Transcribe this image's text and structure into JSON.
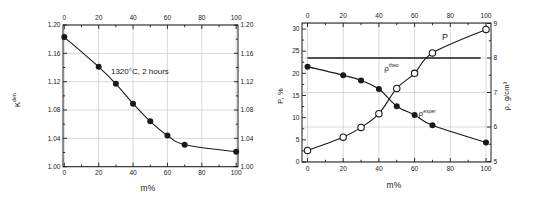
{
  "colors": {
    "ink": "#1a1a1a",
    "grid": "#c9c9c9",
    "paper": "#ffffff"
  },
  "chart_data": [
    {
      "type": "line",
      "title": "",
      "xlabel": "m%",
      "ylabel_base": "K",
      "ylabel_sup": "den",
      "xlim": [
        0,
        100
      ],
      "ylim": [
        1.0,
        1.2
      ],
      "x_ticks": [
        0,
        20,
        40,
        60,
        80,
        100
      ],
      "x_minor_step": 10,
      "y_ticks": [
        1.0,
        1.04,
        1.08,
        1.12,
        1.16,
        1.2
      ],
      "y_tick_labels": [
        "1.00",
        "1.04",
        "1.08",
        "1.12",
        "1.16",
        "1.20"
      ],
      "y_minor_step": 0.02,
      "grid": true,
      "mirror_right_axis": true,
      "legend": "none",
      "annotations": [
        {
          "base": "1320°C, 2 hours",
          "sup": "",
          "x": 44,
          "y": 1.131,
          "size": 8
        }
      ],
      "series": [
        {
          "name": "K",
          "marker": "filled-circle",
          "line": "smooth",
          "x": [
            0,
            20,
            30,
            40,
            50,
            60,
            70,
            100
          ],
          "y": [
            1.183,
            1.141,
            1.117,
            1.089,
            1.064,
            1.044,
            1.031,
            1.021
          ]
        }
      ]
    },
    {
      "type": "line",
      "title": "",
      "xlabel": "m%",
      "ylabel_left": "P, %",
      "ylabel_right": "ρ, g/cm³",
      "xlim": [
        0,
        100
      ],
      "ylim_left": [
        0,
        30
      ],
      "ylim_right": [
        5,
        9
      ],
      "x_ticks": [
        0,
        20,
        40,
        60,
        80,
        100
      ],
      "x_minor_step": 10,
      "y_left_ticks": [
        0,
        5,
        10,
        15,
        20,
        25,
        30
      ],
      "y_left_minor_step": 2.5,
      "y_right_ticks": [
        5,
        6,
        7,
        8,
        9
      ],
      "y_right_minor_step": 0.5,
      "grid": true,
      "legend": "none",
      "annotations": [
        {
          "base": "P",
          "sup": "",
          "x": 77,
          "y": 27.6,
          "size": 9
        },
        {
          "base": "ρ",
          "sup": "theo",
          "x": 47,
          "y": 20.6,
          "size": 8
        },
        {
          "base": "ρ",
          "sup": "exper",
          "x": 67,
          "y": 10.3,
          "size": 8
        }
      ],
      "series": [
        {
          "name": "P",
          "axis": "left",
          "marker": "open-circle",
          "line": "smooth",
          "x": [
            0,
            20,
            30,
            40,
            50,
            60,
            70,
            100
          ],
          "y": [
            2.6,
            5.6,
            7.8,
            10.9,
            16.6,
            20.0,
            24.6,
            29.9
          ]
        },
        {
          "name": "rho-exper",
          "axis": "right",
          "marker": "filled-circle",
          "line": "smooth",
          "x": [
            0,
            20,
            30,
            40,
            50,
            60,
            70,
            100
          ],
          "y": [
            7.75,
            7.5,
            7.35,
            7.1,
            6.6,
            6.35,
            6.05,
            5.55
          ]
        },
        {
          "name": "rho-theo",
          "axis": "right",
          "marker": "none",
          "line": "straight",
          "width": 1.4,
          "x": [
            0,
            97
          ],
          "y": [
            8.0,
            8.0
          ]
        }
      ]
    }
  ]
}
